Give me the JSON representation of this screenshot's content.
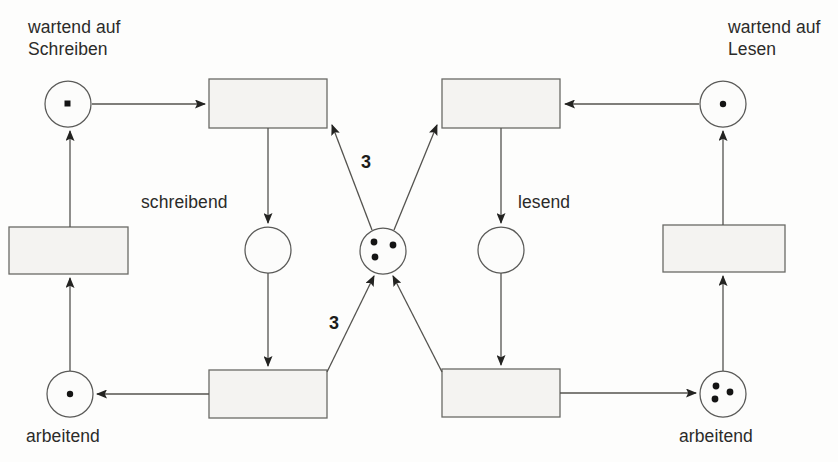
{
  "diagram": {
    "kind": "petri-net",
    "title": "",
    "canvas": {
      "width": 838,
      "height": 462
    },
    "labels": {
      "top_left": "wartend auf\nSchreiben",
      "top_right": "wartend auf\nLesen",
      "mid_left": "schreibend",
      "mid_right": "lesend",
      "bottom_left": "arbeitend",
      "bottom_right": "arbeitend"
    },
    "arc_weights": {
      "upper": "3",
      "lower": "3"
    },
    "places": [
      {
        "id": "p-wartend-schreiben",
        "name": "wartend auf Schreiben",
        "cx": 68,
        "cy": 104,
        "r": 23,
        "tokens": 1,
        "token_shape": "square"
      },
      {
        "id": "p-schreibend",
        "name": "schreibend",
        "cx": 268,
        "cy": 250,
        "r": 23,
        "tokens": 0,
        "token_shape": "dot"
      },
      {
        "id": "p-central",
        "name": "semaphor",
        "cx": 383,
        "cy": 251,
        "r": 23,
        "tokens": 3,
        "token_shape": "dot"
      },
      {
        "id": "p-lesend",
        "name": "lesend",
        "cx": 501,
        "cy": 250,
        "r": 23,
        "tokens": 0,
        "token_shape": "dot"
      },
      {
        "id": "p-wartend-lesen",
        "name": "wartend auf Lesen",
        "cx": 723,
        "cy": 104,
        "r": 23,
        "tokens": 1,
        "token_shape": "dot"
      },
      {
        "id": "p-arbeitend-left",
        "name": "arbeitend",
        "cx": 70,
        "cy": 394,
        "r": 23,
        "tokens": 1,
        "token_shape": "dot"
      },
      {
        "id": "p-arbeitend-right",
        "name": "arbeitend",
        "cx": 723,
        "cy": 394,
        "r": 23,
        "tokens": 3,
        "token_shape": "dot"
      }
    ],
    "transitions": [
      {
        "id": "t-begin-write",
        "x": 209,
        "y": 79,
        "w": 118,
        "h": 49
      },
      {
        "id": "t-begin-read",
        "x": 442,
        "y": 79,
        "w": 118,
        "h": 49
      },
      {
        "id": "t-request-write",
        "x": 9,
        "y": 227,
        "w": 119,
        "h": 47
      },
      {
        "id": "t-request-read",
        "x": 663,
        "y": 225,
        "w": 122,
        "h": 47
      },
      {
        "id": "t-end-write",
        "x": 209,
        "y": 370,
        "w": 118,
        "h": 48
      },
      {
        "id": "t-end-read",
        "x": 442,
        "y": 369,
        "w": 118,
        "h": 48
      }
    ]
  }
}
